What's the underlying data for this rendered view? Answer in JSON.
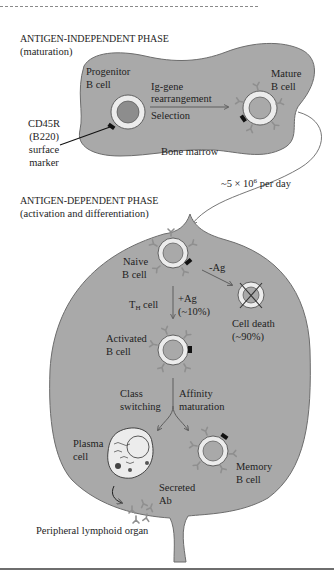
{
  "figure": {
    "top_rule": "dashed",
    "bottom_rule": "solid",
    "colors": {
      "tissue_fill": "#a9a9a9",
      "tissue_stroke": "#6d6d6d",
      "cell_ring": "#ececec",
      "nucleus_progenitor": "#8d8d8d",
      "receptor": "#8f8f8f",
      "marker": "#111111",
      "text": "#1e1e1e"
    }
  },
  "phase_independent": {
    "title": "ANTIGEN-INDEPENDENT PHASE",
    "subtitle": "(maturation)",
    "tissue_label": "Bone marrow",
    "progenitor": {
      "line1": "Progenitor",
      "line2": "B cell"
    },
    "step": {
      "line1": "Ig-gene",
      "line2": "rearrangement",
      "line3": "Selection"
    },
    "mature": {
      "line1": "Mature",
      "line2": "B cell"
    },
    "marker_label": {
      "line1": "CD45R",
      "line2": "(B220)",
      "line3": "surface",
      "line4": "marker"
    }
  },
  "migration": {
    "prefix": "~5 × 10",
    "exponent": "6",
    "suffix": " per day"
  },
  "phase_dependent": {
    "title": "ANTIGEN-DEPENDENT PHASE",
    "subtitle": "(activation and differentiation)",
    "tissue_label": "Peripheral lymphoid organ",
    "naive": {
      "line1": "Naive",
      "line2": "B cell"
    },
    "no_antigen": "-Ag",
    "death": {
      "line1": "Cell death",
      "line2": "(~90%)"
    },
    "th_cell": {
      "main": "T",
      "sub": "H",
      "rest": " cell"
    },
    "with_antigen": {
      "line1": "+Ag",
      "line2": "(~10%)"
    },
    "activated": {
      "line1": "Activated",
      "line2": "B cell"
    },
    "class_switch": {
      "line1": "Class",
      "line2": "switching"
    },
    "affinity": {
      "line1": "Affinity",
      "line2": "maturation"
    },
    "plasma": {
      "line1": "Plasma",
      "line2": "cell"
    },
    "secreted": {
      "line1": "Secreted",
      "line2": "Ab"
    },
    "memory": {
      "line1": "Memory",
      "line2": "B cell"
    }
  }
}
